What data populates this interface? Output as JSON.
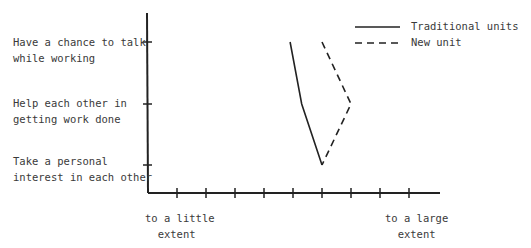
{
  "chart_data": {
    "type": "line",
    "title": "",
    "xlabel": "",
    "ylabel": "",
    "x_tick_count": 9,
    "x_scale_labels": {
      "low": "to a little\nextent",
      "high": "to a large\nextent"
    },
    "categories": [
      "Have a chance to talk while working",
      "Help each other in getting work done",
      "Take a personal interest in each other"
    ],
    "xlim": [
      1,
      9
    ],
    "series": [
      {
        "name": "Traditional units",
        "style": "solid",
        "values": [
          4.9,
          5.3,
          6.0
        ]
      },
      {
        "name": "New unit",
        "style": "dashed",
        "values": [
          6.0,
          7.0,
          6.0
        ]
      }
    ],
    "legend_position": "top-right",
    "grid": false
  },
  "labels": {
    "y1": "Have a chance to talk\nwhile working",
    "y2": "Help each other in\ngetting work done",
    "y3": "Take a personal\ninterest in each other",
    "x_low": "to a little\n  extent",
    "x_high": "to a large\n  extent",
    "legend_traditional": "Traditional units",
    "legend_new": "New unit"
  }
}
